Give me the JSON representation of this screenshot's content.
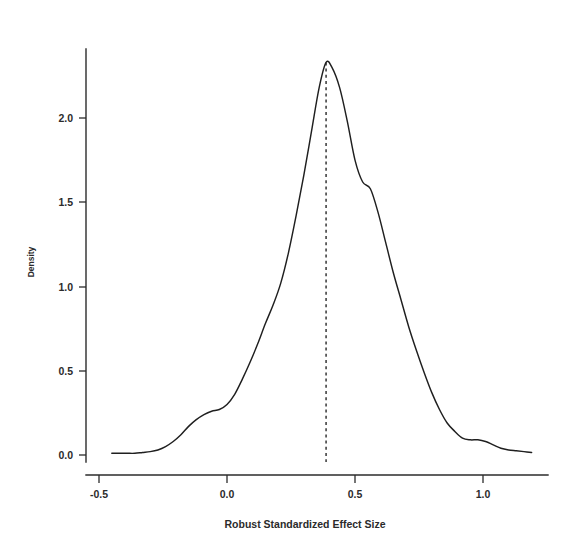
{
  "chart_data": {
    "type": "line",
    "title": "",
    "subtitle": "",
    "xlabel": "Robust Standardized Effect Size",
    "ylabel": "Density",
    "xlim": [
      -0.58,
      1.22
    ],
    "ylim": [
      -0.02,
      2.42
    ],
    "grid": false,
    "legend": null,
    "legend_position": "none",
    "x_ticks": [
      -0.5,
      0.0,
      0.5,
      1.0
    ],
    "x_tick_labels": [
      "-0.5",
      "0.0",
      "0.5",
      "1.0"
    ],
    "y_ticks": [
      0.0,
      0.5,
      1.0,
      1.5,
      2.0
    ],
    "y_tick_labels": [
      "0.0",
      "0.5",
      "1.0",
      "1.5",
      "2.0"
    ],
    "series": [
      {
        "name": "Kernel density of robust standardized effect size",
        "style": "solid",
        "color": "#1f1f1f",
        "x": [
          -0.45,
          -0.42,
          -0.39,
          -0.36,
          -0.33,
          -0.3,
          -0.27,
          -0.24,
          -0.21,
          -0.18,
          -0.15,
          -0.12,
          -0.09,
          -0.06,
          -0.03,
          0.0,
          0.03,
          0.06,
          0.09,
          0.12,
          0.15,
          0.18,
          0.21,
          0.24,
          0.27,
          0.3,
          0.33,
          0.36,
          0.387,
          0.41,
          0.44,
          0.47,
          0.5,
          0.53,
          0.56,
          0.59,
          0.62,
          0.65,
          0.68,
          0.71,
          0.74,
          0.77,
          0.8,
          0.83,
          0.86,
          0.89,
          0.92,
          0.95,
          0.98,
          1.01,
          1.04,
          1.07,
          1.1,
          1.13,
          1.16,
          1.19
        ],
        "y": [
          0.01,
          0.01,
          0.01,
          0.01,
          0.015,
          0.02,
          0.03,
          0.05,
          0.08,
          0.12,
          0.17,
          0.21,
          0.24,
          0.26,
          0.27,
          0.3,
          0.36,
          0.45,
          0.55,
          0.66,
          0.78,
          0.89,
          1.02,
          1.2,
          1.42,
          1.66,
          1.92,
          2.18,
          2.33,
          2.3,
          2.18,
          1.98,
          1.75,
          1.62,
          1.58,
          1.44,
          1.26,
          1.08,
          0.92,
          0.76,
          0.62,
          0.49,
          0.37,
          0.27,
          0.19,
          0.14,
          0.1,
          0.09,
          0.09,
          0.08,
          0.06,
          0.04,
          0.03,
          0.025,
          0.02,
          0.015
        ]
      }
    ],
    "annotations": [
      {
        "type": "vertical-line",
        "name": "mean-reference-line",
        "x": 0.387,
        "style": "dashed",
        "color": "#1f1f1f",
        "label": ""
      }
    ]
  },
  "axis": {
    "x_title": "Robust Standardized Effect Size",
    "y_title": "Density"
  }
}
